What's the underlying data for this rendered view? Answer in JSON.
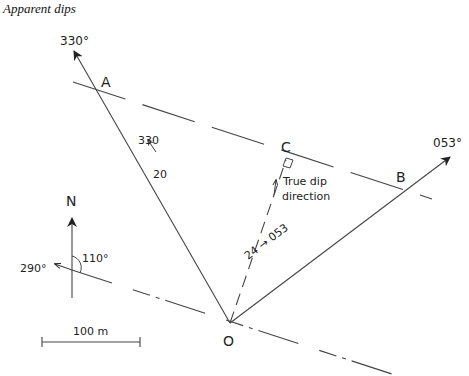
{
  "title": "Apparent dips",
  "labels": {
    "bearing_330": "330°",
    "bearing_053": "053°",
    "bearing_290": "290°",
    "angle_110": "110°",
    "north": "N",
    "point_a": "A",
    "point_b": "B",
    "point_c": "C",
    "point_o": "O",
    "dip_a_azimuth": "330",
    "dip_a_angle": "20",
    "dip_b": "24 → 053",
    "true_dip_line1": "True dip",
    "true_dip_line2": "direction",
    "scale": "100 m"
  },
  "colors": {
    "line": "#444444",
    "text": "#222222"
  }
}
